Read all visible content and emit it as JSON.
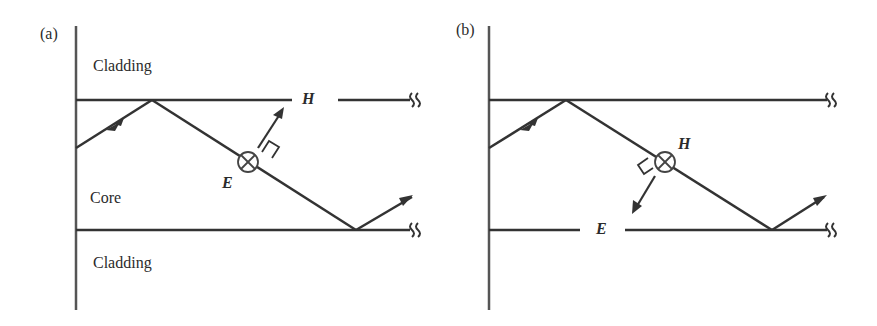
{
  "figure": {
    "panels": [
      {
        "id": "a",
        "label": "(a)",
        "regions": {
          "top_cladding": "Cladding",
          "core": "Core",
          "bottom_cladding": "Cladding"
        },
        "field_labels": {
          "interface_label": "H",
          "point_label": "E"
        },
        "description": "Ray zig-zagging in core; E field into page (⊗) at ray midpoint, H perpendicular to ray"
      },
      {
        "id": "b",
        "label": "(b)",
        "regions": {
          "top_cladding": "",
          "core": "",
          "bottom_cladding": ""
        },
        "field_labels": {
          "point_label": "H",
          "interface_label": "E"
        },
        "description": "Ray zig-zagging in core; H field into page (⊗) at ray midpoint, E perpendicular to ray"
      }
    ],
    "colors": {
      "line": "#333333",
      "text": "#2b2b2b",
      "background": "#ffffff"
    },
    "symbols": {
      "into_page": "⊗",
      "break_mark": "≀≀"
    }
  }
}
